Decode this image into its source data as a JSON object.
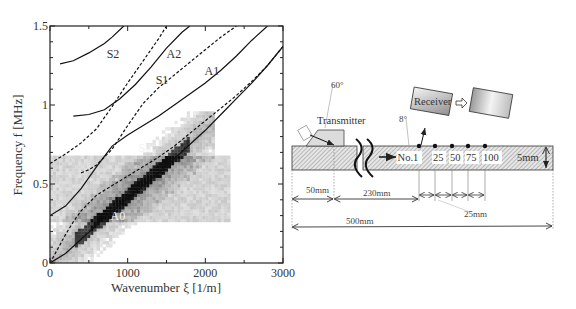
{
  "chart_data": {
    "type": "line",
    "title": "",
    "xlabel": "Wavenumber ξ [1/m]",
    "ylabel": "Frequency f [MHz]",
    "xlim": [
      0,
      3000
    ],
    "ylim": [
      0,
      1.5
    ],
    "xticks": [
      0,
      1000,
      2000,
      3000
    ],
    "yticks": [
      0,
      0.5,
      1,
      1.5
    ],
    "ytick_labels": [
      "0",
      "0.5",
      "1",
      "1.5"
    ],
    "grid": false,
    "background": "grayscale intensity map (measured dispersion spectrum), concentrated along A0/S0 branch up to ~0.9 MHz",
    "series": [
      {
        "name": "A0",
        "style": "solid",
        "x": [
          0,
          200,
          400,
          600,
          800,
          1000,
          1200,
          1400,
          1600,
          1800,
          2000,
          2200,
          2400,
          2600,
          2800,
          3000
        ],
        "y": [
          0,
          0.06,
          0.15,
          0.24,
          0.33,
          0.41,
          0.49,
          0.57,
          0.66,
          0.75,
          0.84,
          0.94,
          1.04,
          1.14,
          1.25,
          1.37
        ]
      },
      {
        "name": "S0",
        "style": "dashed",
        "x": [
          0,
          100,
          200,
          300,
          400,
          600,
          800,
          1000,
          1200,
          1400,
          1600,
          1800,
          2000,
          2200,
          2400,
          2600,
          2800,
          3000
        ],
        "y": [
          0,
          0.09,
          0.18,
          0.26,
          0.33,
          0.43,
          0.49,
          0.55,
          0.61,
          0.67,
          0.74,
          0.82,
          0.9,
          0.98,
          1.06,
          1.15,
          1.25,
          1.37
        ]
      },
      {
        "name": "A1",
        "style": "solid",
        "x": [
          0,
          200,
          400,
          600,
          800,
          1000,
          1200,
          1400,
          1600,
          1800,
          2000,
          2200,
          2400,
          2600,
          2800
        ],
        "y": [
          0.3,
          0.36,
          0.47,
          0.61,
          0.74,
          0.81,
          0.87,
          0.93,
          1.0,
          1.07,
          1.14,
          1.22,
          1.31,
          1.41,
          1.5
        ]
      },
      {
        "name": "S1",
        "style": "dashed",
        "x": [
          400,
          500,
          600,
          800,
          1000,
          1200,
          1400,
          1600,
          1800,
          2000,
          2200,
          2400
        ],
        "y": [
          0.57,
          0.59,
          0.62,
          0.72,
          0.87,
          1.01,
          1.11,
          1.19,
          1.27,
          1.35,
          1.43,
          1.5
        ]
      },
      {
        "name": "A2",
        "style": "solid",
        "x": [
          300,
          500,
          700,
          900,
          1100,
          1300,
          1500,
          1700,
          1800
        ],
        "y": [
          0.93,
          0.94,
          0.97,
          1.04,
          1.13,
          1.24,
          1.36,
          1.46,
          1.5
        ]
      },
      {
        "name": "S2",
        "style": "dashed",
        "x": [
          0,
          200,
          400,
          600,
          800,
          1000,
          1200,
          1400,
          1500
        ],
        "y": [
          0.63,
          0.69,
          0.76,
          0.85,
          0.99,
          1.14,
          1.28,
          1.42,
          1.5
        ]
      },
      {
        "name": "A3",
        "style": "solid",
        "x": [
          130,
          300,
          500,
          700,
          800,
          950
        ],
        "y": [
          1.26,
          1.28,
          1.33,
          1.39,
          1.43,
          1.5
        ]
      }
    ],
    "annotations": [
      {
        "text": "S2",
        "x": 730,
        "y": 1.3
      },
      {
        "text": "A2",
        "x": 1500,
        "y": 1.3
      },
      {
        "text": "S1",
        "x": 1360,
        "y": 1.13
      },
      {
        "text": "A1",
        "x": 1990,
        "y": 1.19
      },
      {
        "text": "S0",
        "x": 1140,
        "y": 0.7
      },
      {
        "text": "A0",
        "x": 780,
        "y": 0.27
      }
    ]
  },
  "diagram": {
    "transmitter_label": "Transmitter",
    "transmitter_angle": "60°",
    "receiver_label": "Receiver",
    "receiver_angle": "8°",
    "positions": [
      "No.1",
      "25",
      "50",
      "75",
      "100"
    ],
    "thickness": "5mm",
    "dim_50": "50mm",
    "dim_230": "230mm",
    "dim_25": "25mm",
    "dim_500": "500mm"
  }
}
